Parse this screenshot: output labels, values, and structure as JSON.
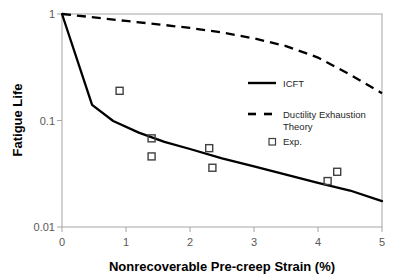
{
  "chart_data": {
    "type": "line",
    "title": "",
    "xlabel": "Nonrecoverable Pre-creep Strain (%)",
    "ylabel": "Fatigue Life",
    "xlim": [
      0,
      5
    ],
    "ylim": [
      0.01,
      1
    ],
    "yscale": "log",
    "xscale": "linear",
    "grid": false,
    "legend_position": "center-right",
    "xticks": [
      "0",
      "1",
      "2",
      "3",
      "4",
      "5"
    ],
    "xtick_values": [
      0,
      1,
      2,
      3,
      4,
      5
    ],
    "yticks": [
      "1",
      "0.1",
      "0.01"
    ],
    "ytick_values": [
      1,
      0.1,
      0.01
    ],
    "series": [
      {
        "name": "ICFT",
        "style": "solid",
        "color": "#000000",
        "x": [
          0,
          0.47,
          0.8,
          1.2,
          1.6,
          2.0,
          2.5,
          3.0,
          3.5,
          4.0,
          4.5,
          5.0
        ],
        "y": [
          1.0,
          0.14,
          0.099,
          0.077,
          0.063,
          0.054,
          0.044,
          0.037,
          0.031,
          0.026,
          0.022,
          0.0175
        ]
      },
      {
        "name": "Ductility Exhaustion Theory",
        "style": "dashed",
        "color": "#000000",
        "x": [
          0,
          0.5,
          1.0,
          1.5,
          2.0,
          2.5,
          3.0,
          3.5,
          4.0,
          4.5,
          5.0
        ],
        "y": [
          1.0,
          0.93,
          0.86,
          0.8,
          0.74,
          0.67,
          0.59,
          0.5,
          0.39,
          0.27,
          0.18
        ]
      },
      {
        "name": "Exp.",
        "style": "marker-open-square",
        "color": "#404040",
        "points": [
          {
            "x": 0.9,
            "y": 0.19
          },
          {
            "x": 1.4,
            "y": 0.068
          },
          {
            "x": 1.4,
            "y": 0.046
          },
          {
            "x": 2.3,
            "y": 0.055
          },
          {
            "x": 2.35,
            "y": 0.036
          },
          {
            "x": 4.15,
            "y": 0.027
          },
          {
            "x": 4.3,
            "y": 0.033
          }
        ]
      }
    ],
    "legend": [
      {
        "label": "ICFT",
        "marker": "solid-line"
      },
      {
        "label": "Ductility Exhaustion",
        "marker": "dashed-line"
      },
      {
        "label": "Theory",
        "marker": "none"
      },
      {
        "label": "Exp.",
        "marker": "open-square"
      }
    ]
  },
  "axes": {
    "x_title": "Nonrecoverable Pre-creep Strain (%)",
    "y_title": "Fatigue Life",
    "x_tick_labels": [
      "0",
      "1",
      "2",
      "3",
      "4",
      "5"
    ],
    "y_tick_labels": [
      "1",
      "0.1",
      "0.01"
    ]
  },
  "legend": {
    "icft_label": "ICFT",
    "det_label_line1": "Ductility Exhaustion",
    "det_label_line2": "Theory",
    "exp_label": "Exp."
  },
  "colors": {
    "line": "#000000",
    "marker_stroke": "#404040",
    "axis": "#a6a6a6",
    "tick_text": "#595959",
    "title_text": "#000000"
  }
}
